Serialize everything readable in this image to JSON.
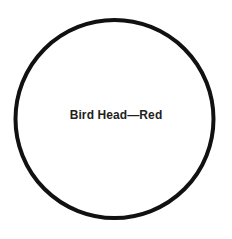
{
  "figure": {
    "type": "circle-diagram",
    "background_color": "#ffffff",
    "canvas": {
      "width": 232,
      "height": 239
    },
    "shape": {
      "name": "circle-outline",
      "center_x": 114.5,
      "center_y": 119,
      "radius": 99,
      "stroke_color": "#111111",
      "stroke_width": 4,
      "fill_color": "#ffffff"
    },
    "label": {
      "text": "Bird Head—Red",
      "color": "#231f20",
      "font_size_px": 12,
      "font_weight": "bold",
      "center_x": 116,
      "center_y": 116
    }
  }
}
